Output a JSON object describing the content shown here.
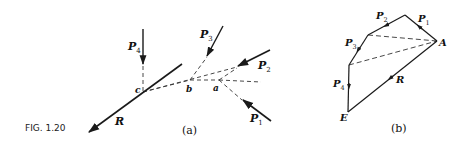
{
  "figure": {
    "caption": "FIG. 1.20",
    "panel_a": {
      "label": "(a)",
      "forces": [
        {
          "name": "P",
          "sub": "1"
        },
        {
          "name": "P",
          "sub": "2"
        },
        {
          "name": "P",
          "sub": "3"
        },
        {
          "name": "P",
          "sub": "4"
        },
        {
          "name": "R",
          "sub": ""
        }
      ],
      "points": [
        "a",
        "b",
        "c"
      ]
    },
    "panel_b": {
      "label": "(b)",
      "forces": [
        {
          "name": "P",
          "sub": "1"
        },
        {
          "name": "P",
          "sub": "2"
        },
        {
          "name": "P",
          "sub": "3"
        },
        {
          "name": "P",
          "sub": "4"
        },
        {
          "name": "R",
          "sub": ""
        }
      ],
      "points": [
        "A",
        "E"
      ]
    }
  },
  "colors": {
    "line": "#1a1a1a",
    "background": "#ffffff"
  }
}
